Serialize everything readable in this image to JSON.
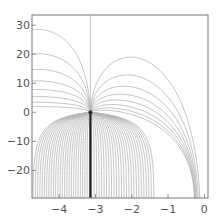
{
  "chart_data": {
    "type": "line",
    "title": "",
    "xlabel": "",
    "ylabel": "",
    "xlim": [
      -4.75,
      0.1
    ],
    "ylim": [
      -29.5,
      33.5
    ],
    "x_ticks": [
      -4,
      -3,
      -2,
      -1,
      0
    ],
    "x_tick_labels": [
      "-4",
      "-3",
      "-2",
      "-1",
      "0"
    ],
    "y_ticks": [
      -20,
      -10,
      0,
      10,
      20,
      30
    ],
    "y_tick_labels": [
      "-20",
      "-10",
      "0",
      "10",
      "20",
      "30"
    ],
    "grid": false,
    "legend": null,
    "source_point": {
      "x": -3.14,
      "y": 0
    },
    "branch_cut": {
      "x": -3.14,
      "y_from": 0,
      "y_to": -29.5,
      "color": "#222222"
    },
    "upper_curve_heights": [
      2,
      3.5,
      5.5,
      8,
      11,
      15,
      20.5,
      29
    ],
    "lower_curve_count": 26,
    "vertical_line_x": -3.14,
    "line_color": "#b8b8b8",
    "frame_color": "#777777"
  }
}
